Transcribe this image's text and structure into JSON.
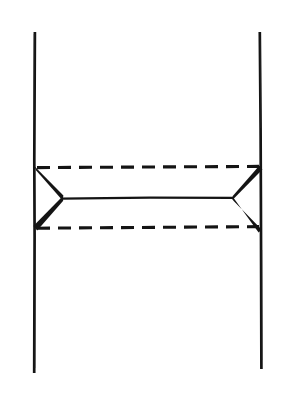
{
  "canvas": {
    "width": 284,
    "height": 398,
    "background_color": "#ffffff",
    "ink_color": "#141414",
    "description": "Hand-drawn scanned line diagram: box-type exchange diagram"
  },
  "diagram": {
    "type": "feynman-box-diagram",
    "elements": {
      "left_fermion_line": {
        "name": "left vertical line",
        "style": "solid",
        "x": 34.5,
        "y_top": 32,
        "y_bottom": 373,
        "stroke_width": 2.6
      },
      "right_fermion_line": {
        "name": "right vertical line",
        "style": "solid",
        "x": 260.5,
        "y_top": 32,
        "y_bottom": 369,
        "stroke_width": 2.6
      },
      "upper_dashed_line": {
        "name": "upper horizontal dashed line",
        "style": "dashed",
        "y": 167,
        "x_start": 36,
        "x_end": 260,
        "stroke_width": 3.0,
        "dash": 13,
        "gap": 8
      },
      "lower_dashed_line": {
        "name": "lower horizontal dashed line",
        "style": "dashed",
        "y": 227,
        "x_start": 36,
        "x_end": 260,
        "stroke_width": 3.0,
        "dash": 13,
        "gap": 8
      },
      "central_solid_line": {
        "name": "central horizontal solid line",
        "style": "solid",
        "y": 198,
        "x_start": 62,
        "x_end": 233,
        "stroke_width": 2.2
      },
      "left_vertex": {
        "name": "left wedge vertex",
        "x": 62,
        "y": 198
      },
      "right_vertex": {
        "name": "right wedge vertex",
        "x": 233,
        "y": 198
      },
      "wedge_upper_left": {
        "name": "upper left tapered wedge",
        "from_x": 35,
        "from_y": 168,
        "to_x": 62,
        "to_y": 198,
        "thick_end": "to"
      },
      "wedge_lower_left": {
        "name": "lower left tapered wedge",
        "from_x": 62,
        "from_y": 198,
        "to_x": 35,
        "to_y": 228,
        "thick_end": "to"
      },
      "wedge_upper_right": {
        "name": "upper right tapered wedge",
        "from_x": 233,
        "from_y": 198,
        "to_x": 260,
        "to_y": 168,
        "thick_end": "to"
      },
      "wedge_lower_right": {
        "name": "lower right tapered wedge",
        "from_x": 233,
        "from_y": 198,
        "to_x": 260,
        "to_y": 228,
        "thick_end": "to"
      }
    }
  }
}
